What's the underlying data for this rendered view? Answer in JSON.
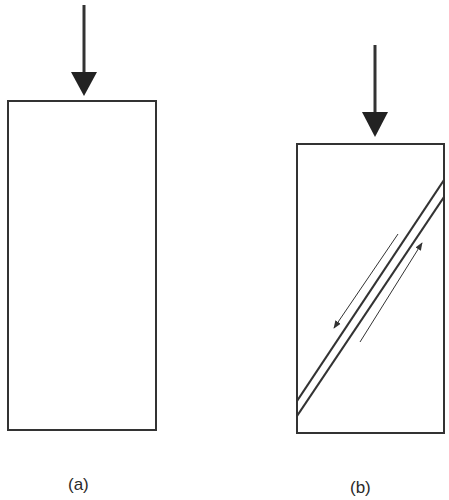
{
  "figure": {
    "panels": [
      {
        "id": "a",
        "label": "(a)",
        "description": "Intact specimen under axial compression",
        "load_arrow": {
          "x": 84,
          "y_start": 5,
          "y_end": 95
        },
        "specimen": {
          "x": 8,
          "y": 101,
          "width": 148,
          "height": 329
        }
      },
      {
        "id": "b",
        "label": "(b)",
        "description": "Specimen with inclined shear fracture under axial compression",
        "load_arrow": {
          "x": 375,
          "y_start": 45,
          "y_end": 136
        },
        "specimen": {
          "x": 297,
          "y": 144,
          "width": 147,
          "height": 289
        },
        "fault_lines": [
          {
            "x1": 297,
            "y1": 401,
            "x2": 444,
            "y2": 180
          },
          {
            "x1": 297,
            "y1": 416,
            "x2": 444,
            "y2": 197
          }
        ],
        "slip_arrows": [
          {
            "direction": "down-left",
            "x1": 398,
            "y1": 234,
            "x2": 334,
            "y2": 328
          },
          {
            "direction": "up-right",
            "x1": 360,
            "y1": 342,
            "x2": 422,
            "y2": 243
          }
        ]
      }
    ],
    "colors": {
      "stroke": "#333333",
      "background": "#ffffff"
    }
  }
}
